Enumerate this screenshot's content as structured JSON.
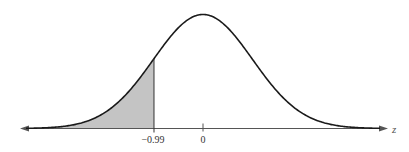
{
  "chart_data": {
    "type": "area",
    "title": "",
    "subtitle": "",
    "xlabel": "z",
    "ylabel": "",
    "distribution": "standard normal",
    "mean": 0,
    "std": 1,
    "xlim": [
      -3.7,
      3.7
    ],
    "ticks": [
      {
        "value": -0.99,
        "label": "−0.99"
      },
      {
        "value": 0,
        "label": "0"
      }
    ],
    "shaded_region": {
      "from": "-infinity",
      "to": -0.99,
      "color": "#c4c4c4"
    },
    "boundary_line": {
      "x": -0.99
    },
    "grid": false,
    "legend": null,
    "axis_arrows": "both"
  },
  "colors": {
    "curve": "#1a1a1a",
    "shade": "#c4c4c4",
    "axis": "#555555",
    "background": "#ffffff"
  },
  "labels": {
    "tick_neg": "−0.99",
    "tick_zero": "0",
    "axis_var": "z"
  }
}
